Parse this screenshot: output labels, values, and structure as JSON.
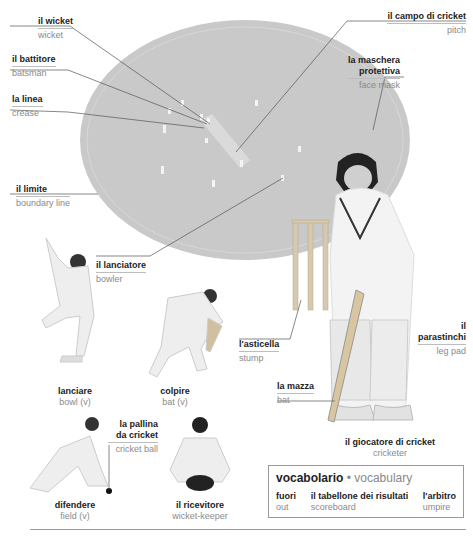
{
  "labels": {
    "wicket": {
      "it": "il wicket",
      "en": "wicket"
    },
    "batsman": {
      "it": "il battitore",
      "en": "batsman"
    },
    "crease": {
      "it": "la linea",
      "en": "crease"
    },
    "boundary": {
      "it": "il limite",
      "en": "boundary line"
    },
    "pitch": {
      "it": "il campo di cricket",
      "en": "pitch"
    },
    "face_mask": {
      "it1": "la maschera",
      "it2": "protettiva",
      "en": "face mask"
    },
    "bowler": {
      "it": "il lanciatore",
      "en": "bowler"
    },
    "stump": {
      "it": "l'asticella",
      "en": "stump"
    },
    "leg_pad": {
      "it1": "il",
      "it2": "parastinchi",
      "en": "leg pad"
    },
    "bat_noun": {
      "it": "la mazza",
      "en": "bat"
    },
    "cricketer": {
      "it": "il giocatore di cricket",
      "en": "cricketer"
    },
    "bowl_verb": {
      "it": "lanciare",
      "en": "bowl (v)"
    },
    "bat_verb": {
      "it": "colpire",
      "en": "bat (v)"
    },
    "cricket_ball": {
      "it1": "la pallina",
      "it2": "da cricket",
      "en": "cricket ball"
    },
    "field_verb": {
      "it": "difendere",
      "en": "field (v)"
    },
    "wicket_keeper": {
      "it": "il ricevitore",
      "en": "wicket-keeper"
    }
  },
  "vocabulary": {
    "title_it": "vocabolario",
    "separator": "•",
    "title_en": "vocabulary",
    "items": [
      {
        "it": "fuori",
        "en": "out"
      },
      {
        "it": "il tabellone dei risultati",
        "en": "scoreboard"
      },
      {
        "it": "l'arbitro",
        "en": "umpire"
      }
    ]
  },
  "colors": {
    "field": "#c9c9c9",
    "leader_line": "#555555",
    "text_it": "#222222",
    "text_en": "#8a8a8a"
  }
}
